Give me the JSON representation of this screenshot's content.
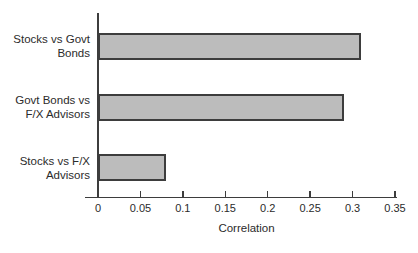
{
  "chart_data": {
    "type": "bar",
    "orientation": "horizontal",
    "title": "",
    "xlabel": "Correlation",
    "ylabel": "",
    "categories": [
      "Stocks vs Govt\nBonds",
      "Govt Bonds vs\nF/X Advisors",
      "Stocks vs F/X\nAdvisors"
    ],
    "values": [
      0.31,
      0.29,
      0.08
    ],
    "xlim": [
      0,
      0.35
    ],
    "xticks": [
      0,
      0.05,
      0.1,
      0.15,
      0.2,
      0.25,
      0.3,
      0.35
    ],
    "xtick_labels": [
      "0",
      "0.05",
      "0.1",
      "0.15",
      "0.2",
      "0.25",
      "0.3",
      "0.35"
    ],
    "grid": "off",
    "legend": "none",
    "bar_fill_color": "#bcbcbc",
    "bar_border_color": "#3d3d3d",
    "axis_color": "#3d3d3d",
    "text_color": "#2b2b2b",
    "background_color": "#ffffff"
  }
}
